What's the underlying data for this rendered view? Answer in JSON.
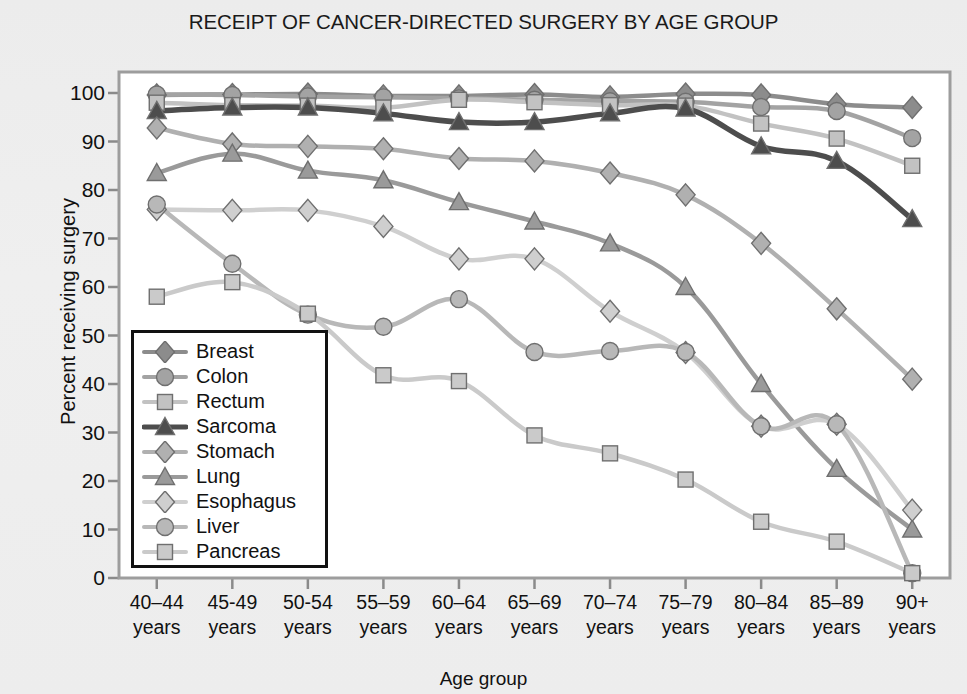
{
  "chart_data": {
    "type": "line",
    "title": "RECEIPT OF CANCER-DIRECTED SURGERY BY AGE GROUP",
    "xlabel": "Age group",
    "ylabel": "Percent receiving surgery",
    "categories": [
      "40–44 years",
      "45-49 years",
      "50-54 years",
      "55–59 years",
      "60–64 years",
      "65–69 years",
      "70–74 years",
      "75–79 years",
      "80–84 years",
      "85–89 years",
      "90+ years"
    ],
    "category_lines": [
      [
        "40–44",
        "years"
      ],
      [
        "45-49",
        "years"
      ],
      [
        "50-54",
        "years"
      ],
      [
        "55–59",
        "years"
      ],
      [
        "60–64",
        "years"
      ],
      [
        "65–69",
        "years"
      ],
      [
        "70–74",
        "years"
      ],
      [
        "75–79",
        "years"
      ],
      [
        "80–84",
        "years"
      ],
      [
        "85–89",
        "years"
      ],
      [
        "90+",
        "years"
      ]
    ],
    "ylim": [
      0,
      100
    ],
    "yticks": [
      0,
      10,
      20,
      30,
      40,
      50,
      60,
      70,
      80,
      90,
      100
    ],
    "ytick_labels": [
      "0",
      "10",
      "20",
      "30",
      "40",
      "50",
      "60",
      "70",
      "80",
      "90",
      "100"
    ],
    "grid": false,
    "legend_position": "inside-lower-left",
    "series": [
      {
        "name": "Breast",
        "marker": "diamond",
        "color": "#8c8c8c",
        "values": [
          99.6,
          99.7,
          99.8,
          99.4,
          99.4,
          99.7,
          99.2,
          99.8,
          99.6,
          97.7,
          97.0
        ]
      },
      {
        "name": "Colon",
        "marker": "circle",
        "color": "#a3a3a3",
        "values": [
          99.7,
          99.6,
          99.3,
          99.1,
          98.9,
          98.6,
          98.3,
          98.2,
          97.1,
          96.3,
          90.7
        ]
      },
      {
        "name": "Rectum",
        "marker": "square",
        "color": "#c2c2c2",
        "values": [
          98.0,
          97.5,
          97.4,
          97.0,
          98.6,
          98.1,
          97.5,
          97.4,
          93.7,
          90.6,
          85.0
        ]
      },
      {
        "name": "Sarcoma",
        "marker": "triangle",
        "color": "#4d4d4d",
        "values": [
          96.3,
          97.0,
          97.0,
          95.8,
          94.0,
          94.0,
          95.8,
          96.8,
          89.0,
          86.0,
          74.0
        ]
      },
      {
        "name": "Stomach",
        "marker": "diamond",
        "color": "#b0b0b0",
        "values": [
          92.8,
          89.5,
          89.0,
          88.5,
          86.5,
          86.0,
          83.5,
          79.0,
          69.0,
          55.5,
          41.0
        ]
      },
      {
        "name": "Lung",
        "marker": "triangle",
        "color": "#9a9a9a",
        "values": [
          83.5,
          87.5,
          84.0,
          82.0,
          77.5,
          73.5,
          69.0,
          60.0,
          40.0,
          22.5,
          10.0
        ]
      },
      {
        "name": "Esophagus",
        "marker": "diamond",
        "color": "#cfcfcf",
        "values": [
          76.0,
          75.8,
          75.8,
          72.5,
          65.8,
          65.8,
          55.0,
          46.5,
          31.3,
          31.7,
          14.0
        ]
      },
      {
        "name": "Liver",
        "marker": "circle",
        "color": "#b8b8b8",
        "values": [
          77.0,
          64.8,
          54.3,
          51.8,
          57.5,
          46.6,
          46.8,
          46.6,
          31.3,
          31.7,
          1.0
        ]
      },
      {
        "name": "Pancreas",
        "marker": "square",
        "color": "#cacaca",
        "values": [
          58.0,
          61.0,
          54.5,
          41.8,
          40.6,
          29.4,
          25.7,
          20.3,
          11.6,
          7.5,
          1.0
        ]
      }
    ]
  },
  "legend": {
    "items": [
      "Breast",
      "Colon",
      "Rectum",
      "Sarcoma",
      "Stomach",
      "Lung",
      "Esophagus",
      "Liver",
      "Pancreas"
    ]
  }
}
